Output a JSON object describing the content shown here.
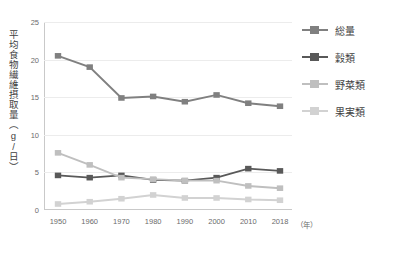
{
  "chart_data": {
    "type": "line",
    "title": "",
    "xlabel": "（年）",
    "ylabel": "平均食物繊維摂取量（g/日）",
    "categories": [
      "1950",
      "1960",
      "1970",
      "1980",
      "1990",
      "2000",
      "2010",
      "2018"
    ],
    "ylim": [
      0,
      25
    ],
    "yticks": [
      "0",
      "5",
      "10",
      "15",
      "20",
      "25"
    ],
    "grid": true,
    "legend_position": "right",
    "series": [
      {
        "name": "総量",
        "color": "#808080",
        "values": [
          20.5,
          19.0,
          14.9,
          15.1,
          14.4,
          15.3,
          14.2,
          13.8
        ]
      },
      {
        "name": "穀類",
        "color": "#595959",
        "values": [
          4.6,
          4.3,
          4.6,
          4.0,
          3.9,
          4.3,
          5.5,
          5.2
        ]
      },
      {
        "name": "野菜類",
        "color": "#bfbfbf",
        "values": [
          7.6,
          6.0,
          4.3,
          4.1,
          3.9,
          3.9,
          3.2,
          2.9
        ]
      },
      {
        "name": "果実類",
        "color": "#d2d2d2",
        "values": [
          0.8,
          1.1,
          1.5,
          2.0,
          1.6,
          1.6,
          1.4,
          1.3
        ]
      }
    ]
  },
  "axis": {
    "y_title": "平均食物繊維摂取量（g/日）",
    "x_unit": "（年）"
  }
}
